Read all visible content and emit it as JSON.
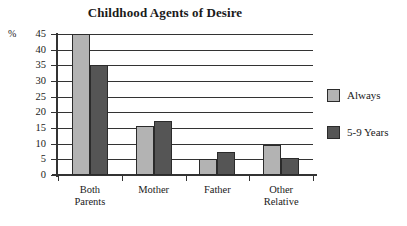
{
  "chart_data": {
    "type": "bar",
    "title": "Childhood Agents of Desire",
    "xlabel": "",
    "ylabel": "%",
    "ylim": [
      0,
      45
    ],
    "yticks": [
      0,
      5,
      10,
      15,
      20,
      25,
      30,
      35,
      40,
      45
    ],
    "grid": true,
    "legend_position": "right",
    "categories": [
      "Both\nParents",
      "Mother",
      "Father",
      "Other\nRelative"
    ],
    "series": [
      {
        "name": "Always",
        "color": "#b3b3b3",
        "values": [
          45,
          15.7,
          5,
          9.6
        ]
      },
      {
        "name": "5-9 Years",
        "color": "#555555",
        "values": [
          35.2,
          17.3,
          7.3,
          5.5
        ]
      }
    ]
  },
  "axis": {
    "unit_label": "%",
    "tick_labels": [
      "45",
      "40",
      "35",
      "30",
      "25",
      "20",
      "15",
      "10",
      "5",
      "0"
    ]
  },
  "legend": {
    "items": [
      {
        "label": "Always"
      },
      {
        "label": "5-9 Years"
      }
    ]
  }
}
